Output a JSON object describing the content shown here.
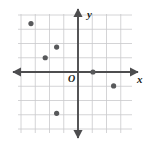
{
  "figure": {
    "name": "coordinate-plane-scatter",
    "background": "#ffffff"
  },
  "labels": {
    "x_axis": "x",
    "y_axis": "y",
    "origin": "O"
  },
  "style": {
    "grid_color": "#c9c9cb",
    "axis_color": "#4d4d4f",
    "point_color": "#58595b",
    "label_color": "#231f20",
    "point_radius": 2.6,
    "grid_cell_px": 14.25
  },
  "geometry": {
    "plot_left": 18,
    "plot_top": 14,
    "plot_right": 132,
    "plot_bottom": 133,
    "origin_x_px": 78,
    "origin_y_px": 72,
    "cols": 8,
    "rows": 8.35
  },
  "chart_data": {
    "type": "scatter",
    "title": "",
    "xlabel": "x",
    "ylabel": "y",
    "grid": true,
    "legend": null,
    "tick_labels": [],
    "xlim": [
      -4.2,
      3.8
    ],
    "ylim": [
      -4.1,
      4.1
    ],
    "points": [
      {
        "x": -3.3,
        "y": 3.4
      },
      {
        "x": -1.5,
        "y": 1.75
      },
      {
        "x": -2.3,
        "y": 1.0
      },
      {
        "x": 1.05,
        "y": 0.0
      },
      {
        "x": 2.5,
        "y": -0.98
      },
      {
        "x": -1.5,
        "y": -2.9
      }
    ],
    "annotations": [
      {
        "text": "O",
        "x": -0.7,
        "y": -0.35
      },
      {
        "text": "y",
        "x": 0.65,
        "y": 4.4
      },
      {
        "text": "x",
        "x": 4.15,
        "y": -0.35
      }
    ]
  }
}
